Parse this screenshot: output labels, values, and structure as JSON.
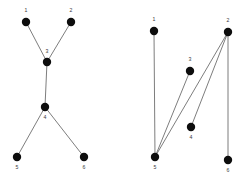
{
  "figure": {
    "background_color": "#ffffff",
    "node_color": "#0d0d0d",
    "edge_color": "#6e6e6e",
    "label_color": "#3a3a3a",
    "width": 246,
    "height": 187
  },
  "chart_data": {
    "type": "diagram",
    "title": "",
    "subtitle": "",
    "xlabel": "",
    "ylabel": "",
    "grid": false,
    "legend": "none",
    "panels": [
      {
        "name": "left-graph",
        "caption": "",
        "nodes": [
          {
            "id": "1",
            "label": "1",
            "x": 26,
            "y": 22,
            "r": 4.2,
            "label_x": 26,
            "label_y": 11
          },
          {
            "id": "2",
            "label": "2",
            "x": 71,
            "y": 22,
            "r": 4.2,
            "label_x": 71,
            "label_y": 11
          },
          {
            "id": "3",
            "label": "3",
            "x": 47,
            "y": 62,
            "r": 4.2,
            "label_x": 47,
            "label_y": 52
          },
          {
            "id": "4",
            "label": "4",
            "x": 45,
            "y": 107,
            "r": 4.2,
            "label_x": 45,
            "label_y": 118
          },
          {
            "id": "5",
            "label": "5",
            "x": 17,
            "y": 157,
            "r": 4.2,
            "label_x": 17,
            "label_y": 168
          },
          {
            "id": "6",
            "label": "6",
            "x": 84,
            "y": 157,
            "r": 4.2,
            "label_x": 84,
            "label_y": 168
          }
        ],
        "edges": [
          {
            "source": "1",
            "target": "3",
            "x1": 26,
            "y1": 22,
            "x2": 47,
            "y2": 62
          },
          {
            "source": "2",
            "target": "3",
            "x1": 71,
            "y1": 22,
            "x2": 47,
            "y2": 62
          },
          {
            "source": "3",
            "target": "4",
            "x1": 47,
            "y1": 62,
            "x2": 45,
            "y2": 107
          },
          {
            "source": "4",
            "target": "5",
            "x1": 45,
            "y1": 107,
            "x2": 17,
            "y2": 157
          },
          {
            "source": "4",
            "target": "6",
            "x1": 45,
            "y1": 107,
            "x2": 84,
            "y2": 157
          }
        ]
      },
      {
        "name": "right-graph",
        "caption": "",
        "nodes": [
          {
            "id": "1",
            "label": "1",
            "x": 154,
            "y": 31,
            "r": 4.2,
            "label_x": 154,
            "label_y": 20
          },
          {
            "id": "2",
            "label": "2",
            "x": 228,
            "y": 32,
            "r": 4.2,
            "label_x": 228,
            "label_y": 21
          },
          {
            "id": "3",
            "label": "3",
            "x": 190,
            "y": 71,
            "r": 4.2,
            "label_x": 190,
            "label_y": 60
          },
          {
            "id": "4",
            "label": "4",
            "x": 191,
            "y": 127,
            "r": 4.2,
            "label_x": 191,
            "label_y": 138
          },
          {
            "id": "5",
            "label": "5",
            "x": 155,
            "y": 157,
            "r": 4.2,
            "label_x": 155,
            "label_y": 168
          },
          {
            "id": "6",
            "label": "6",
            "x": 228,
            "y": 160,
            "r": 4.2,
            "label_x": 228,
            "label_y": 171
          }
        ],
        "edges": [
          {
            "source": "1",
            "target": "5",
            "x1": 154,
            "y1": 31,
            "x2": 155,
            "y2": 157
          },
          {
            "source": "3",
            "target": "5",
            "x1": 190,
            "y1": 71,
            "x2": 155,
            "y2": 157
          },
          {
            "source": "2",
            "target": "5",
            "x1": 228,
            "y1": 32,
            "x2": 155,
            "y2": 157
          },
          {
            "source": "2",
            "target": "4",
            "x1": 228,
            "y1": 32,
            "x2": 191,
            "y2": 127
          },
          {
            "source": "2",
            "target": "6",
            "x1": 228,
            "y1": 32,
            "x2": 228,
            "y2": 160
          }
        ]
      }
    ]
  }
}
